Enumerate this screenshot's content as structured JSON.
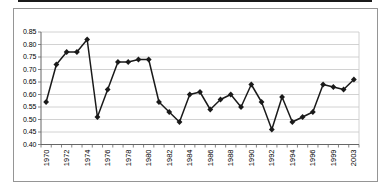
{
  "chart_data": {
    "type": "line",
    "title": "",
    "xlabel": "",
    "ylabel": "",
    "categories": [
      "1970",
      "1971",
      "1972",
      "1973",
      "1974",
      "1975",
      "1976",
      "1977",
      "1978",
      "1979",
      "1980",
      "1981",
      "1982",
      "1983",
      "1984",
      "1985",
      "1986",
      "1987",
      "1988",
      "1989",
      "1990",
      "1991",
      "1992",
      "1993",
      "1994",
      "1995",
      "1996",
      "1997",
      "1999",
      "2001",
      "2003"
    ],
    "values": [
      0.57,
      0.72,
      0.77,
      0.77,
      0.82,
      0.51,
      0.62,
      0.73,
      0.73,
      0.74,
      0.74,
      0.57,
      0.53,
      0.49,
      0.6,
      0.61,
      0.54,
      0.58,
      0.6,
      0.55,
      0.64,
      0.57,
      0.46,
      0.59,
      0.49,
      0.51,
      0.53,
      0.64,
      0.63,
      0.62,
      0.66
    ],
    "ylim": [
      0.4,
      0.85
    ],
    "y_tick_step": 0.05,
    "y_tick_labels": [
      "0.85",
      "0.80",
      "0.75",
      "0.70",
      "0.65",
      "0.60",
      "0.55",
      "0.50",
      "0.45",
      "0.40"
    ],
    "x_tick_labels_shown": [
      "1970",
      "1972",
      "1974",
      "1976",
      "1978",
      "1980",
      "1982",
      "1984",
      "1986",
      "1988",
      "1990",
      "1992",
      "1994",
      "1996",
      "1999",
      "2003"
    ],
    "x_label_every_n": 2,
    "grid": true,
    "legend_visible": false,
    "marker": "diamond",
    "line_color": "#1a1a1a",
    "marker_color": "#1a1a1a",
    "gridline_color": "#c6c6c6",
    "axis_color": "#666666",
    "frame_border_color": "#959595",
    "background_color": "#ffffff",
    "top_rule_color": "#1a1a1a"
  }
}
